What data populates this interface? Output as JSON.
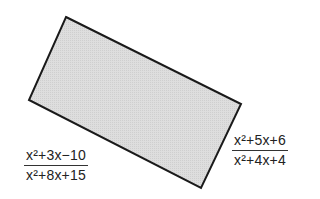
{
  "figure": {
    "shape": "rectangle",
    "fill_color": "#dcdcdc",
    "stroke_color": "#1a1a1a",
    "corners": [
      [
        66,
        17
      ],
      [
        241,
        104
      ],
      [
        201,
        188
      ],
      [
        29,
        100
      ]
    ]
  },
  "labels": {
    "side_left": {
      "numerator": "x²+3x−10",
      "denominator": "x²+8x+15"
    },
    "side_right": {
      "numerator": "x²+5x+6",
      "denominator": "x²+4x+4"
    }
  }
}
